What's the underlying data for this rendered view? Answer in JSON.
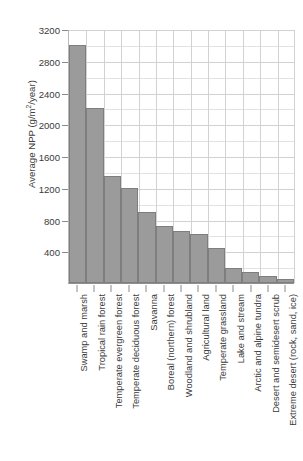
{
  "top_caption_remnant": "",
  "axes": {
    "ylabel_prefix": "Average NPP (g/m",
    "ylabel_sup": "2",
    "ylabel_suffix": "/year)",
    "yticks": [
      "400",
      "800",
      "1200",
      "1600",
      "2000",
      "2400",
      "2800",
      "3200"
    ]
  },
  "chart_data": {
    "type": "bar",
    "title": "",
    "xlabel": "",
    "ylabel": "Average NPP (g/m2/year)",
    "ylim": [
      0,
      3200
    ],
    "ytick_values": [
      400,
      800,
      1200,
      1600,
      2000,
      2400,
      2800,
      3200
    ],
    "grid": true,
    "legend": "none",
    "bar_color": "#9b9b9b",
    "bar_edge_color": "#7e7e7e",
    "categories": [
      "Swamp and marsh",
      "Tropical rain forest",
      "Temperate evergreen forest",
      "Temperate deciduous forest",
      "Savanna",
      "Boreal (northern) forest",
      "Woodland and shrubland",
      "Agricultural land",
      "Temperate grassland",
      "Lake and stream",
      "Arctic and alpine tundra",
      "Desert and semidesert scrub",
      "Extreme desert (rock, sand, ice)"
    ],
    "values": [
      3000,
      2200,
      1350,
      1200,
      900,
      720,
      650,
      620,
      440,
      190,
      140,
      90,
      50
    ]
  }
}
